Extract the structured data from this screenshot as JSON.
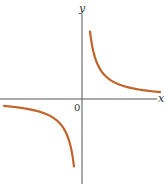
{
  "chart_data": {
    "type": "line",
    "title": "",
    "function": "y = k/x (rectangular hyperbola, k > 0)",
    "xlabel": "x",
    "ylabel": "y",
    "origin_label": "0",
    "grid": false,
    "legend": null,
    "ticks": [],
    "k": 5.4,
    "xlim": [
      -8.2,
      7.8
    ],
    "ylim": [
      -8.4,
      8.4
    ],
    "series": [
      {
        "name": "branch-quadrant-I",
        "color": "#c0642a",
        "x": [
          0.8,
          1.0,
          1.5,
          2.0,
          2.5,
          3.0,
          4.0,
          5.0,
          6.0,
          7.0,
          7.8
        ],
        "y": [
          6.75,
          5.4,
          3.6,
          2.7,
          2.16,
          1.8,
          1.35,
          1.08,
          0.9,
          0.77,
          0.69
        ]
      },
      {
        "name": "branch-quadrant-III",
        "color": "#c0642a",
        "x": [
          -7.8,
          -7.0,
          -6.0,
          -5.0,
          -4.0,
          -3.0,
          -2.5,
          -2.0,
          -1.5,
          -1.0,
          -0.8
        ],
        "y": [
          -0.69,
          -0.77,
          -0.9,
          -1.08,
          -1.35,
          -1.8,
          -2.16,
          -2.7,
          -3.6,
          -5.4,
          -6.75
        ]
      }
    ]
  },
  "colors": {
    "curve": "#c0642a",
    "axis": "#555555",
    "background": "#ffffff"
  },
  "layout": {
    "origin_px": [
      82,
      99
    ],
    "px_per_unit": 10
  }
}
